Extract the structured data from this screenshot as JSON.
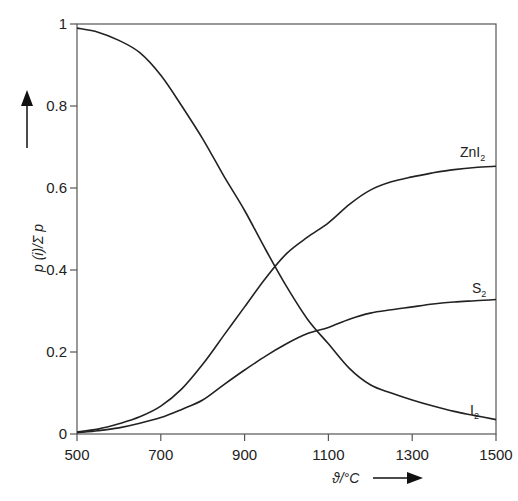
{
  "chart_data": {
    "type": "line",
    "title": "",
    "xlabel": "ϑ/°C",
    "ylabel": "p (i)/Σ p",
    "xlim": [
      500,
      1500
    ],
    "ylim": [
      0,
      1
    ],
    "xticks": [
      500,
      700,
      900,
      1100,
      1300,
      1500
    ],
    "yticks": [
      0,
      0.2,
      0.4,
      0.6,
      0.8,
      1
    ],
    "ytick_labels": [
      "0",
      "0.2",
      "0.4",
      "0.6",
      "0.8",
      "1"
    ],
    "grid": false,
    "legend": "inline labels at right end of curves",
    "series": [
      {
        "name": "I2",
        "label_main": "I",
        "label_sub": "2",
        "x": [
          500,
          550,
          600,
          650,
          700,
          750,
          800,
          850,
          900,
          950,
          1000,
          1050,
          1100,
          1150,
          1200,
          1250,
          1300,
          1350,
          1400,
          1450,
          1500
        ],
        "values": [
          0.99,
          0.98,
          0.96,
          0.93,
          0.875,
          0.8,
          0.72,
          0.63,
          0.545,
          0.45,
          0.36,
          0.28,
          0.22,
          0.16,
          0.12,
          0.1,
          0.083,
          0.068,
          0.055,
          0.045,
          0.035
        ]
      },
      {
        "name": "ZnI2",
        "label_main": "ZnI",
        "label_sub": "2",
        "x": [
          500,
          550,
          600,
          650,
          700,
          750,
          800,
          850,
          900,
          950,
          1000,
          1050,
          1100,
          1150,
          1200,
          1250,
          1300,
          1350,
          1400,
          1450,
          1500
        ],
        "values": [
          0.005,
          0.012,
          0.025,
          0.042,
          0.068,
          0.11,
          0.17,
          0.24,
          0.31,
          0.38,
          0.44,
          0.48,
          0.515,
          0.56,
          0.595,
          0.615,
          0.627,
          0.637,
          0.645,
          0.65,
          0.653
        ]
      },
      {
        "name": "S2",
        "label_main": "S",
        "label_sub": "2",
        "x": [
          500,
          550,
          600,
          650,
          700,
          750,
          800,
          850,
          900,
          950,
          1000,
          1050,
          1100,
          1150,
          1200,
          1250,
          1300,
          1350,
          1400,
          1450,
          1500
        ],
        "values": [
          0.003,
          0.008,
          0.015,
          0.026,
          0.04,
          0.06,
          0.083,
          0.12,
          0.156,
          0.19,
          0.22,
          0.245,
          0.26,
          0.28,
          0.295,
          0.303,
          0.31,
          0.317,
          0.322,
          0.325,
          0.328
        ]
      }
    ]
  },
  "labels": {
    "y_axis": "p (i)/Σ p",
    "x_axis": "ϑ/°C"
  },
  "style": {
    "line_color": "#222222",
    "axis_color": "#555555"
  }
}
